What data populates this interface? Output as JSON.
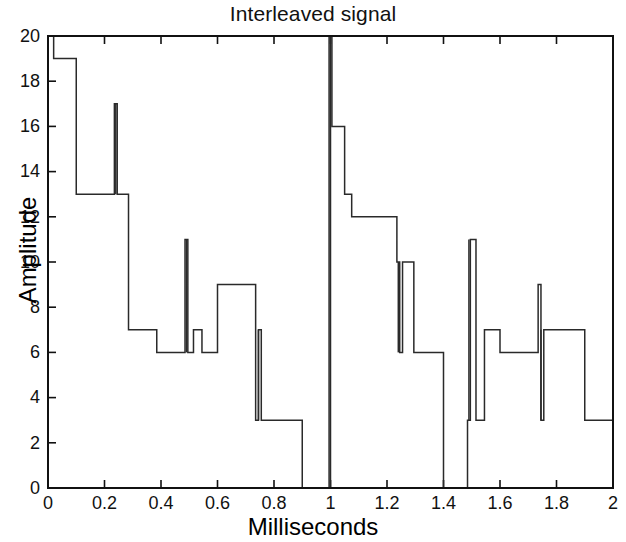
{
  "chart_data": {
    "type": "line",
    "title": "Interleaved signal",
    "xlabel": "Milliseconds",
    "ylabel": "Amplitude",
    "xlim": [
      0,
      2
    ],
    "ylim": [
      0,
      20
    ],
    "grid": false,
    "legend": null,
    "drawstyle": "steps-post",
    "xticks": [
      0,
      0.2,
      0.4,
      0.6,
      0.8,
      1,
      1.2,
      1.4,
      1.6,
      1.8,
      2
    ],
    "xtick_labels": [
      "0",
      "0.2",
      "0.4",
      "0.6",
      "0.8",
      "1",
      "1.2",
      "1.4",
      "1.6",
      "1.8",
      "2"
    ],
    "yticks": [
      0,
      2,
      4,
      6,
      8,
      10,
      12,
      14,
      16,
      18,
      20
    ],
    "ytick_labels": [
      "0",
      "2",
      "4",
      "6",
      "8",
      "10",
      "12",
      "14",
      "16",
      "18",
      "20"
    ],
    "series": [
      {
        "name": "interleaved signal",
        "x": [
          0.0,
          0.02,
          0.1,
          0.235,
          0.245,
          0.285,
          0.385,
          0.485,
          0.495,
          0.515,
          0.545,
          0.6,
          0.735,
          0.745,
          0.755,
          0.9,
          0.995,
          1.005,
          1.05,
          1.075,
          1.235,
          1.245,
          1.255,
          1.295,
          1.4,
          1.485,
          1.495,
          1.515,
          1.545,
          1.6,
          1.735,
          1.745,
          1.755,
          1.9,
          2.0
        ],
        "y": [
          20,
          19,
          13,
          17,
          13,
          7,
          6,
          11,
          6,
          7,
          6,
          9,
          3,
          7,
          3,
          0,
          20,
          16,
          13,
          12,
          10,
          6,
          10,
          6,
          0,
          3,
          11,
          3,
          7,
          6,
          9,
          3,
          7,
          3,
          0
        ],
        "values_description": "Staircase/step waveform with narrow impulse spikes"
      }
    ],
    "spikes": [
      {
        "x": 0.24,
        "peak": 17,
        "base": 13
      },
      {
        "x": 0.49,
        "peak": 11,
        "base": 6
      },
      {
        "x": 0.745,
        "peak": 7,
        "base": 3
      },
      {
        "x": 1.0,
        "peak": 20,
        "base": 0
      },
      {
        "x": 1.24,
        "peak": 10,
        "base": 6
      },
      {
        "x": 1.49,
        "peak": 11,
        "base": 3
      },
      {
        "x": 1.745,
        "peak": 7,
        "base": 3
      }
    ],
    "segments": [
      {
        "x0": 0.0,
        "x1": 0.02,
        "y": 20
      },
      {
        "x0": 0.02,
        "x1": 0.1,
        "y": 19
      },
      {
        "x0": 0.1,
        "x1": 0.285,
        "y": 13
      },
      {
        "x0": 0.285,
        "x1": 0.385,
        "y": 7
      },
      {
        "x0": 0.385,
        "x1": 0.485,
        "y": 6
      },
      {
        "x0": 0.495,
        "x1": 0.515,
        "y": 7
      },
      {
        "x0": 0.515,
        "x1": 0.6,
        "y": 6
      },
      {
        "x0": 0.6,
        "x1": 0.735,
        "y": 9
      },
      {
        "x0": 0.755,
        "x1": 0.9,
        "y": 3
      },
      {
        "x0": 0.9,
        "x1": 0.995,
        "y": 0
      },
      {
        "x0": 1.005,
        "x1": 1.05,
        "y": 16
      },
      {
        "x0": 1.05,
        "x1": 1.075,
        "y": 13
      },
      {
        "x0": 1.075,
        "x1": 1.235,
        "y": 12
      },
      {
        "x0": 1.245,
        "x1": 1.295,
        "y": 6
      },
      {
        "x0": 1.295,
        "x1": 1.4,
        "y": 0
      },
      {
        "x0": 1.4,
        "x1": 1.485,
        "y": 3
      },
      {
        "x0": 1.495,
        "x1": 1.515,
        "y": 7
      },
      {
        "x0": 1.515,
        "x1": 1.6,
        "y": 6
      },
      {
        "x0": 1.6,
        "x1": 1.735,
        "y": 9
      },
      {
        "x0": 1.755,
        "x1": 1.9,
        "y": 3
      },
      {
        "x0": 1.9,
        "x1": 2.0,
        "y": 0
      }
    ],
    "colors": {
      "line": "#2a2a2a",
      "axis": "#111111",
      "background": "#ffffff"
    }
  }
}
